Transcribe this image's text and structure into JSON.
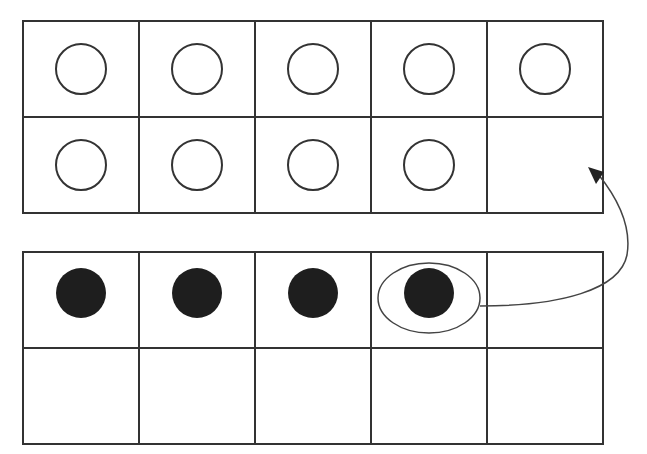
{
  "diagram": {
    "type": "ten-frames",
    "colors": {
      "stroke": "#333333",
      "counter_fill": "#1e1e1e",
      "background": "#ffffff"
    },
    "top_frame": {
      "rows": 2,
      "cols": 5,
      "cells": [
        "open",
        "open",
        "open",
        "open",
        "open",
        "open",
        "open",
        "open",
        "open",
        "empty"
      ],
      "count": 9
    },
    "bottom_frame": {
      "rows": 2,
      "cols": 5,
      "cells": [
        "filled",
        "filled",
        "filled",
        "filled",
        "empty",
        "empty",
        "empty",
        "empty",
        "empty",
        "empty"
      ],
      "count": 4,
      "circled_index": 3
    },
    "arrow": {
      "from": "bottom_frame.cell_4",
      "to": "top_frame.cell_10"
    }
  }
}
